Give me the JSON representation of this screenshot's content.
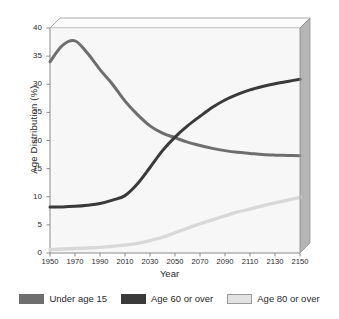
{
  "chart_data": {
    "type": "line",
    "title": "",
    "xlabel": "Year",
    "ylabel": "Age Distribution (%)",
    "xlim": [
      1950,
      2150
    ],
    "ylim": [
      0,
      40
    ],
    "xticks": [
      "1950",
      "1970",
      "1990",
      "2010",
      "2030",
      "2050",
      "2070",
      "2090",
      "2110",
      "2130",
      "2150"
    ],
    "yticks": [
      "0",
      "5",
      "10",
      "15",
      "20",
      "25",
      "30",
      "35",
      "40"
    ],
    "grid": false,
    "legend_position": "bottom",
    "x": [
      1950,
      1960,
      1970,
      1980,
      1990,
      2000,
      2010,
      2020,
      2030,
      2040,
      2050,
      2060,
      2070,
      2080,
      2090,
      2100,
      2110,
      2120,
      2130,
      2140,
      2150
    ],
    "series": [
      {
        "name": "Under age 15",
        "color": "#6e6e6e",
        "values": [
          34.0,
          36.9,
          37.7,
          35.5,
          32.6,
          30.0,
          27.0,
          24.6,
          22.6,
          21.3,
          20.5,
          19.7,
          19.1,
          18.6,
          18.2,
          17.9,
          17.7,
          17.5,
          17.4,
          17.35,
          17.3
        ]
      },
      {
        "name": "Age 60 or over",
        "color": "#3a3a3a",
        "values": [
          8.2,
          8.2,
          8.3,
          8.5,
          8.8,
          9.4,
          10.2,
          12.3,
          15.2,
          18.2,
          20.6,
          22.6,
          24.3,
          25.9,
          27.2,
          28.2,
          29.0,
          29.6,
          30.1,
          30.5,
          30.9
        ]
      },
      {
        "name": "Age 80 or over",
        "color": "#d8d8d8",
        "values": [
          0.6,
          0.7,
          0.8,
          0.9,
          1.0,
          1.2,
          1.4,
          1.7,
          2.2,
          2.8,
          3.6,
          4.4,
          5.2,
          5.9,
          6.6,
          7.3,
          7.8,
          8.4,
          8.9,
          9.4,
          9.9
        ]
      }
    ]
  },
  "axis": {
    "y_title": "Age Distribution (%)",
    "x_title": "Year"
  },
  "legend": {
    "items": [
      {
        "label": "Under age 15",
        "color": "#6e6e6e"
      },
      {
        "label": "Age 60 or over",
        "color": "#3a3a3a"
      },
      {
        "label": "Age 80 or over",
        "color": "#e2e2e2"
      }
    ]
  },
  "style": {
    "plot_background": "#f7f7f7",
    "panel_side": "#b5b5b5",
    "panel_top": "#fbfbfb",
    "axis_color": "#8a8a8a"
  }
}
